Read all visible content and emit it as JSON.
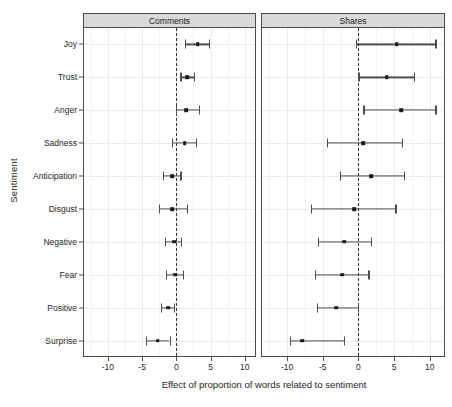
{
  "chart_data": {
    "type": "scatter",
    "subtype": "forest-plot-with-error-bars",
    "title": "",
    "xlabel": "Effect of proportion of words related to sentiment",
    "ylabel": "Sentiment",
    "categories": [
      "Joy",
      "Trust",
      "Anger",
      "Sadness",
      "Anticipation",
      "Disgust",
      "Negative",
      "Fear",
      "Positive",
      "Surprise"
    ],
    "facets": [
      "Comments",
      "Shares"
    ],
    "xticks": [
      -10,
      -5,
      0,
      5,
      10
    ],
    "xlim_comments": [
      -13.5,
      11.5
    ],
    "xlim_shares": [
      -13.5,
      12.0
    ],
    "grid": true,
    "legend": "none",
    "reference_line": 0,
    "reference_line_style": "dashed",
    "series": [
      {
        "name": "Comments",
        "points": [
          {
            "category": "Joy",
            "estimate": 3.1,
            "low": 1.2,
            "high": 4.8
          },
          {
            "category": "Trust",
            "estimate": 1.6,
            "low": 0.6,
            "high": 2.6
          },
          {
            "category": "Anger",
            "estimate": 1.4,
            "low": -0.1,
            "high": 3.3
          },
          {
            "category": "Sadness",
            "estimate": 1.2,
            "low": -0.6,
            "high": 2.9
          },
          {
            "category": "Anticipation",
            "estimate": -0.6,
            "low": -2.0,
            "high": 0.6
          },
          {
            "category": "Disgust",
            "estimate": -0.6,
            "low": -2.6,
            "high": 1.5
          },
          {
            "category": "Negative",
            "estimate": -0.3,
            "low": -1.7,
            "high": 0.7
          },
          {
            "category": "Fear",
            "estimate": -0.2,
            "low": -1.5,
            "high": 1.0
          },
          {
            "category": "Positive",
            "estimate": -1.2,
            "low": -2.3,
            "high": -0.3
          },
          {
            "category": "Surprise",
            "estimate": -2.7,
            "low": -4.5,
            "high": -1.0
          }
        ]
      },
      {
        "name": "Shares",
        "points": [
          {
            "category": "Joy",
            "estimate": 5.4,
            "low": -0.3,
            "high": 10.8
          },
          {
            "category": "Trust",
            "estimate": 4.0,
            "low": 0.0,
            "high": 7.8
          },
          {
            "category": "Anger",
            "estimate": 6.0,
            "low": 0.7,
            "high": 10.8
          },
          {
            "category": "Sadness",
            "estimate": 0.7,
            "low": -4.4,
            "high": 6.1
          },
          {
            "category": "Anticipation",
            "estimate": 1.8,
            "low": -2.6,
            "high": 6.4
          },
          {
            "category": "Disgust",
            "estimate": -0.6,
            "low": -6.6,
            "high": 5.2
          },
          {
            "category": "Negative",
            "estimate": -2.0,
            "low": -5.7,
            "high": 1.8
          },
          {
            "category": "Fear",
            "estimate": -2.3,
            "low": -6.1,
            "high": 1.4
          },
          {
            "category": "Positive",
            "estimate": -3.1,
            "low": -5.8,
            "high": -0.1
          },
          {
            "category": "Surprise",
            "estimate": -7.9,
            "low": -9.6,
            "high": -2.0
          }
        ]
      }
    ]
  },
  "colors": {
    "point": "#1a1a1a",
    "bar": "#4d4d4d",
    "grid": "#ebebeb",
    "strip_bg": "#d9d9d9",
    "panel_border": "#4d4d4d",
    "zero_line": "#333333"
  }
}
